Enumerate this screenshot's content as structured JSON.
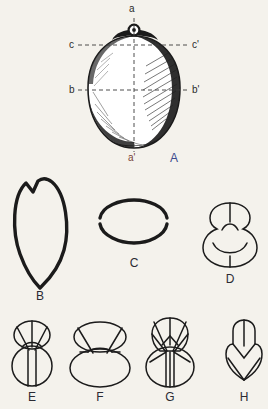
{
  "plate": {
    "title": "Seed morphology plate",
    "background_color": "#f4f2ec",
    "ink_color": "#1b1b1b"
  },
  "figure_a": {
    "label": "A",
    "label_color": "#3b4a8c",
    "description": "shaded whole seed, ventral view with reference axes",
    "axes": [
      {
        "name": "axis-a",
        "start_label": "a",
        "end_label": "a'",
        "orientation": "vertical",
        "style": "dashed"
      },
      {
        "name": "axis-b",
        "start_label": "b",
        "end_label": "b'",
        "orientation": "horizontal",
        "style": "dashed"
      },
      {
        "name": "axis-c",
        "start_label": "c",
        "end_label": "c'",
        "orientation": "horizontal",
        "style": "dashed"
      }
    ],
    "labels": {
      "a": "a",
      "a_prime": "a'",
      "b": "b",
      "b_prime": "b'",
      "c": "c",
      "c_prime": "c'"
    },
    "label_colors": {
      "a": "#2b2b2b",
      "a_prime": "#7a4438",
      "b": "#2b2b2b",
      "b_prime": "#2b2b2b",
      "c": "#2b2b2b",
      "c_prime": "#2b2b2b"
    }
  },
  "outline_figures": [
    {
      "key": "B",
      "label": "B",
      "shape": "pointed-ovate-with-apical-notch",
      "row": 1
    },
    {
      "key": "C",
      "label": "C",
      "shape": "transverse-ellipse",
      "row": 1
    },
    {
      "key": "D",
      "label": "D",
      "shape": "bilobed-gourd-with-median-line",
      "row": 1
    },
    {
      "key": "E",
      "label": "E",
      "shape": "small-upper-lobe-round-lower-lobe",
      "row": 2
    },
    {
      "key": "F",
      "label": "F",
      "shape": "wide-upper-lobe-broad-lower-oval",
      "row": 2
    },
    {
      "key": "G",
      "label": "G",
      "shape": "angular-segmented-bilobed",
      "row": 2
    },
    {
      "key": "H",
      "label": "H",
      "shape": "small-crested-lobe",
      "row": 2
    }
  ]
}
